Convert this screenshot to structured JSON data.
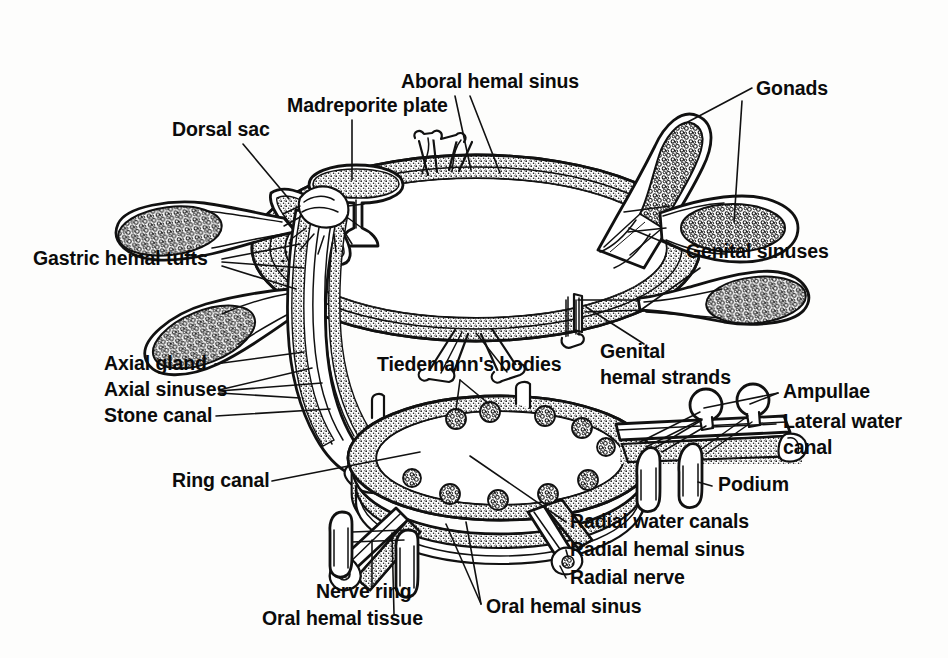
{
  "figure": {
    "background_color": "#fdfdfc",
    "ink_color": "#111111",
    "style": "black and white line drawing with stippled texture"
  },
  "labels": [
    {
      "id": "aboral-hemal-sinus",
      "text": "Aboral hemal sinus",
      "x": 401,
      "y": 88,
      "anchor": "start",
      "lines": [
        "Aboral hemal sinus"
      ]
    },
    {
      "id": "madreporite-plate",
      "text": "Madreporite plate",
      "x": 287,
      "y": 112,
      "anchor": "start",
      "lines": [
        "Madreporite plate"
      ]
    },
    {
      "id": "dorsal-sac",
      "text": "Dorsal sac",
      "x": 172,
      "y": 136,
      "anchor": "start",
      "lines": [
        "Dorsal sac"
      ]
    },
    {
      "id": "gonads",
      "text": "Gonads",
      "x": 756,
      "y": 95,
      "anchor": "start",
      "lines": [
        "Gonads"
      ]
    },
    {
      "id": "genital-sinuses",
      "text": "Genital sinuses",
      "x": 686,
      "y": 258,
      "anchor": "start",
      "lines": [
        "Genital sinuses"
      ]
    },
    {
      "id": "gastric-hemal-tufts",
      "text": "Gastric hemal tufts",
      "x": 33,
      "y": 265,
      "anchor": "start",
      "lines": [
        "Gastric hemal tufts"
      ]
    },
    {
      "id": "axial-gland",
      "text": "Axial gland",
      "x": 104,
      "y": 370,
      "anchor": "start",
      "lines": [
        "Axial gland"
      ]
    },
    {
      "id": "axial-sinuses",
      "text": "Axial sinuses",
      "x": 104,
      "y": 396,
      "anchor": "start",
      "lines": [
        "Axial sinuses"
      ]
    },
    {
      "id": "stone-canal",
      "text": "Stone canal",
      "x": 104,
      "y": 422,
      "anchor": "start",
      "lines": [
        "Stone canal"
      ]
    },
    {
      "id": "tiedemanns-bodies",
      "text": "Tiedemann's bodies",
      "x": 377,
      "y": 371,
      "anchor": "start",
      "lines": [
        "Tiedemann's bodies"
      ]
    },
    {
      "id": "genital-hemal-strands",
      "text": "Genital hemal strands",
      "x": 600,
      "y": 358,
      "anchor": "start",
      "lines": [
        "Genital",
        "hemal strands"
      ]
    },
    {
      "id": "ampullae",
      "text": "Ampullae",
      "x": 783,
      "y": 398,
      "anchor": "start",
      "lines": [
        "Ampullae"
      ]
    },
    {
      "id": "lateral-water-canal",
      "text": "Lateral water canal",
      "x": 783,
      "y": 428,
      "anchor": "start",
      "lines": [
        "Lateral water",
        "canal"
      ]
    },
    {
      "id": "ring-canal",
      "text": "Ring canal",
      "x": 172,
      "y": 487,
      "anchor": "start",
      "lines": [
        "Ring canal"
      ]
    },
    {
      "id": "podium",
      "text": "Podium",
      "x": 718,
      "y": 491,
      "anchor": "start",
      "lines": [
        "Podium"
      ]
    },
    {
      "id": "radial-water-canals",
      "text": "Radial water canals",
      "x": 570,
      "y": 528,
      "anchor": "start",
      "lines": [
        "Radial water canals"
      ]
    },
    {
      "id": "radial-hemal-sinus",
      "text": "Radial hemal sinus",
      "x": 570,
      "y": 556,
      "anchor": "start",
      "lines": [
        "Radial hemal sinus"
      ]
    },
    {
      "id": "radial-nerve",
      "text": "Radial nerve",
      "x": 570,
      "y": 584,
      "anchor": "start",
      "lines": [
        "Radial nerve"
      ]
    },
    {
      "id": "nerve-ring",
      "text": "Nerve ring",
      "x": 316,
      "y": 598,
      "anchor": "start",
      "lines": [
        "Nerve ring"
      ]
    },
    {
      "id": "oral-hemal-tissue",
      "text": "Oral hemal tissue",
      "x": 262,
      "y": 625,
      "anchor": "start",
      "lines": [
        "Oral hemal tissue"
      ]
    },
    {
      "id": "oral-hemal-sinus",
      "text": "Oral hemal sinus",
      "x": 486,
      "y": 613,
      "anchor": "start",
      "lines": [
        "Oral hemal sinus"
      ]
    }
  ],
  "structures": [
    {
      "id": "aboral-hemal-ring",
      "name": "Aboral hemal sinus ring",
      "description": "large stippled elliptical ring at top of figure"
    },
    {
      "id": "madreporite",
      "name": "Madreporite plate",
      "description": "funnel / mushroom shaped stippled plate on top left of aboral ring"
    },
    {
      "id": "dorsal-sac",
      "name": "Dorsal sac",
      "description": "elongated stippled sac left of madreporite"
    },
    {
      "id": "gonad-upper-right",
      "name": "Gonad",
      "description": "coarse stippled club extending upper right"
    },
    {
      "id": "gonad-right",
      "name": "Gonad",
      "description": "coarse stippled club extending right"
    },
    {
      "id": "gonad-lower-right",
      "name": "Gonad",
      "description": "coarse stippled club extending lower right"
    },
    {
      "id": "gastric-tuft-upper-left",
      "name": "Gastric hemal tuft",
      "description": "coarse stippled club extending upper left"
    },
    {
      "id": "gastric-tuft-lower-left",
      "name": "Gastric hemal tuft",
      "description": "coarse stippled club extending lower left"
    },
    {
      "id": "axial-complex",
      "name": "Axial gland / axial sinuses / stone canal",
      "description": "vertical bundle of stippled tubes connecting aboral ring to oral ring"
    },
    {
      "id": "ring-canal",
      "name": "Ring canal",
      "description": "lower elliptical ring bearing Tiedemann's bodies"
    },
    {
      "id": "tiedemanns-bodies",
      "name": "Tiedemann's bodies",
      "count": 10,
      "description": "small knobby stippled lobes spaced around ring canal"
    },
    {
      "id": "oral-hemal-ring",
      "name": "Oral hemal sinus ring",
      "description": "stippled band beneath the ring canal"
    },
    {
      "id": "nerve-ring",
      "name": "Nerve ring",
      "description": "plain band below the oral hemal ring"
    },
    {
      "id": "radial-arm-right",
      "name": "Radial arm (right)",
      "description": "radial water canal with lateral water canals, ampullae and podia extending right"
    },
    {
      "id": "radial-arm-lower-left",
      "name": "Radial arm (lower left)",
      "description": "radial canal with two podia extending lower left"
    },
    {
      "id": "radial-arm-lower-right",
      "name": "Radial arm (lower right)",
      "description": "radial canal extending lower right"
    },
    {
      "id": "ampullae",
      "name": "Ampullae",
      "count": 2,
      "description": "two round bulbs on upper side of lateral canals"
    },
    {
      "id": "podia",
      "name": "Podia",
      "count": 2,
      "description": "two tube feet on lower side of the right radial arm"
    }
  ]
}
